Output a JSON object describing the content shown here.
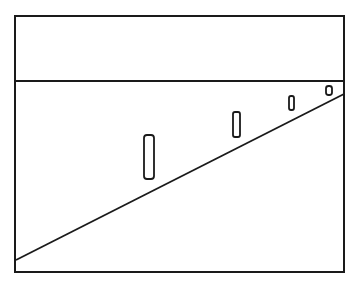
{
  "diagram": {
    "stroke_color": "#1a1a1a",
    "background": "#ffffff",
    "frame": {
      "x": 15,
      "y": 16,
      "width": 329,
      "height": 256
    },
    "divider": {
      "x1": 15,
      "y1": 81,
      "x2": 344,
      "y2": 81
    },
    "slope_line": {
      "x1": 16,
      "y1": 260,
      "x2": 344,
      "y2": 94
    },
    "posts": [
      {
        "x": 144,
        "y": 135,
        "width": 10,
        "height": 44,
        "rx": 3
      },
      {
        "x": 233,
        "y": 112,
        "width": 7,
        "height": 25,
        "rx": 2
      },
      {
        "x": 289,
        "y": 96,
        "width": 5,
        "height": 14,
        "rx": 2
      },
      {
        "x": 326,
        "y": 86,
        "width": 6,
        "height": 9,
        "rx": 2.5
      }
    ]
  }
}
